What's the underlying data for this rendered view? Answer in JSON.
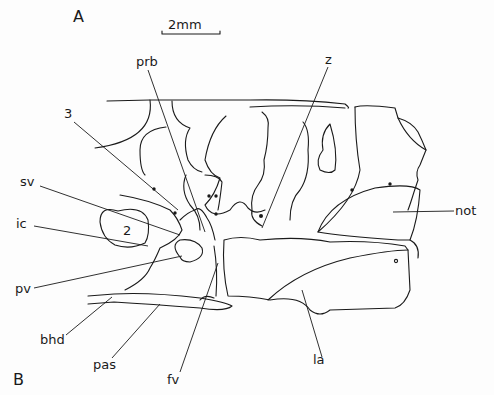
{
  "figure": {
    "panel_labels": {
      "top": "A",
      "bottom": "B"
    },
    "scale_bar": {
      "label": "2mm"
    },
    "labels": {
      "prb": "prb",
      "z": "z",
      "n3": "3",
      "sv": "sv",
      "ic": "ic",
      "n2": "2",
      "pv": "pv",
      "bhd": "bhd",
      "pas": "pas",
      "fv": "fv",
      "la": "la",
      "not": "not"
    }
  }
}
